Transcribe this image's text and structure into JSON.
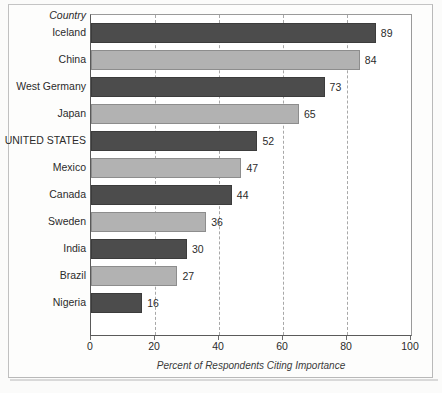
{
  "figure": {
    "category_header": "Country",
    "colors": {
      "bar_dark": "#4c4c4c",
      "bar_light": "#b2b2b2",
      "grid": "#a8a8a8",
      "axis": "#5a5a5a",
      "text": "#2b2b2b",
      "background": "#fdfdfc"
    }
  },
  "chart_data": {
    "type": "bar",
    "orientation": "horizontal",
    "title": "",
    "subtitle": "",
    "xlabel": "Percent of Respondents Citing Importance",
    "ylabel": "Country",
    "xlim": [
      0,
      100
    ],
    "xticks": [
      0,
      20,
      40,
      60,
      80,
      100
    ],
    "xtick_labels": [
      "0",
      "20",
      "40",
      "60",
      "80",
      "100"
    ],
    "grid": "vertical dashed gridlines at 20, 40, 60, 80",
    "legend": "none",
    "value_labels": true,
    "categories": [
      "Iceland",
      "China",
      "West Germany",
      "Japan",
      "UNITED STATES",
      "Mexico",
      "Canada",
      "Sweden",
      "India",
      "Brazil",
      "Nigeria"
    ],
    "values": [
      89,
      84,
      73,
      65,
      52,
      47,
      44,
      36,
      30,
      27,
      16
    ],
    "value_label_text": [
      "89",
      "84",
      "73",
      "65",
      "52",
      "47",
      "44",
      "36",
      "30",
      "27",
      "16"
    ],
    "bar_shades": [
      "dark",
      "light",
      "dark",
      "light",
      "dark",
      "light",
      "dark",
      "light",
      "dark",
      "light",
      "dark"
    ]
  }
}
